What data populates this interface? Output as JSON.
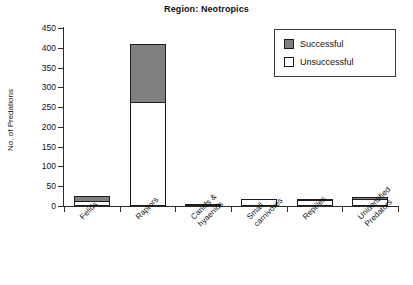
{
  "chart_data": {
    "type": "bar",
    "subtype": "stacked-vertical",
    "title": "Region: Neotropics",
    "xlabel": "",
    "ylabel": "No. of Predations",
    "ylim": [
      0,
      450
    ],
    "ytick_step": 50,
    "yticks": [
      0,
      50,
      100,
      150,
      200,
      250,
      300,
      350,
      400,
      450
    ],
    "ytick_labels": [
      "0",
      "50",
      "100",
      "150",
      "200",
      "250",
      "300",
      "350",
      "400",
      "450"
    ],
    "grid": false,
    "legend_position": "top-right",
    "categories": [
      "Felids",
      "Raptors",
      "Canids &\nhyaenids",
      "Small\ncarnivores",
      "Reptiles",
      "Unidentified\nPredators"
    ],
    "series": [
      {
        "name": "Unsuccessful",
        "color": "#ffffff",
        "values": [
          12,
          263,
          3,
          18,
          14,
          18
        ]
      },
      {
        "name": "Successful",
        "color": "#808080",
        "values": [
          17,
          149,
          0,
          0,
          5,
          8
        ]
      }
    ],
    "totals": [
      29,
      412,
      3,
      18,
      19,
      26
    ]
  },
  "legend": {
    "entries": [
      {
        "label": "Successful",
        "color": "#808080"
      },
      {
        "label": "Unsuccessful",
        "color": "#ffffff"
      }
    ]
  },
  "colors": {
    "successful": "#808080",
    "unsuccessful": "#ffffff",
    "axis": "#2b2b2b",
    "text": "#111111",
    "background": "#ffffff"
  }
}
